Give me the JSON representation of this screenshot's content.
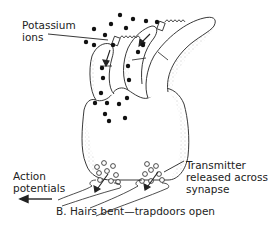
{
  "labels": {
    "potassium_line1": "Potassium",
    "potassium_line2": "ions",
    "action_line1": "Action",
    "action_line2": "potentials",
    "transmitter_line1": "Transmitter",
    "transmitter_line2": "released across",
    "transmitter_line3": "synapse"
  },
  "caption": "B. Hairs bent—trapdoors open",
  "colors": {
    "ink": "#222222",
    "stipple": "#8a8a8a",
    "background": "#ffffff"
  }
}
